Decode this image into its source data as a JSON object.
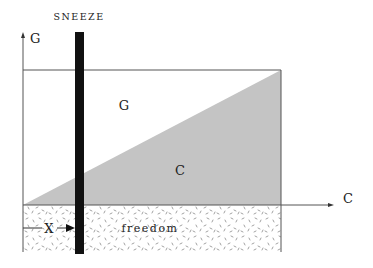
{
  "diagram": {
    "title": "SNEEZE",
    "y_axis_label": "G",
    "x_axis_label": "C",
    "region_upper_label": "G",
    "region_lower_label": "C",
    "floor_label": "freedom",
    "marker_label": "X",
    "colors": {
      "triangle_fill": "#c4c4c4",
      "bar": "#111111",
      "lines": "#555555",
      "speckle": "#888888"
    }
  }
}
